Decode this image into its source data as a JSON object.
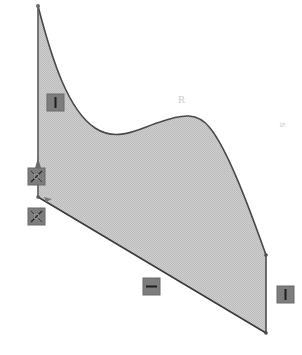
{
  "sketch": {
    "title": "",
    "fill_color": "#c8c8c8",
    "stroke_color": "#4a4a4a",
    "relation_icon_color": "#7a7a7a",
    "profile": {
      "spline_start": [
        38,
        6
      ],
      "spline_peak": [
        185,
        117
      ],
      "spline_valley": [
        120,
        143
      ],
      "spline_end": [
        266,
        255
      ],
      "right_line_bottom": [
        266,
        333
      ],
      "bottom_line_start": [
        38,
        197
      ],
      "left_line_top": [
        38,
        6
      ]
    },
    "relations": [
      {
        "name": "vertical-relation-left",
        "glyph": "vertical",
        "x": 47,
        "y": 94
      },
      {
        "name": "coincident-relation-1",
        "glyph": "coincident",
        "x": 28,
        "y": 168
      },
      {
        "name": "coincident-relation-2",
        "glyph": "coincident",
        "x": 28,
        "y": 208
      },
      {
        "name": "horizontal-relation-bottom",
        "glyph": "horizontal",
        "x": 143,
        "y": 278
      },
      {
        "name": "vertical-relation-right",
        "glyph": "vertical",
        "x": 277,
        "y": 286
      }
    ],
    "annotations": {
      "peak_label": "R",
      "side_label": "S"
    }
  }
}
